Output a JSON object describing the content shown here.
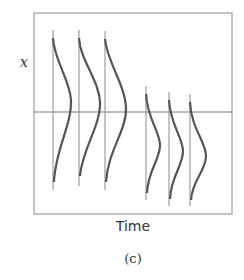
{
  "figure": {
    "y_axis_label": "x",
    "x_axis_label": "Time",
    "caption": "(c)",
    "colors": {
      "frame": "#8a8a8a",
      "curve": "#555555",
      "baseline": "#7a7a7a"
    },
    "distributions": [
      {
        "time_index": 1,
        "group": "before",
        "peak_position": "upper",
        "width": "broad"
      },
      {
        "time_index": 2,
        "group": "before",
        "peak_position": "upper",
        "width": "broad"
      },
      {
        "time_index": 3,
        "group": "before",
        "peak_position": "upper",
        "width": "broad"
      },
      {
        "time_index": 4,
        "group": "after",
        "peak_position": "below-axis",
        "width": "narrow"
      },
      {
        "time_index": 5,
        "group": "after",
        "peak_position": "below-axis",
        "width": "narrow"
      },
      {
        "time_index": 6,
        "group": "after",
        "peak_position": "below-axis",
        "width": "narrow"
      }
    ]
  }
}
